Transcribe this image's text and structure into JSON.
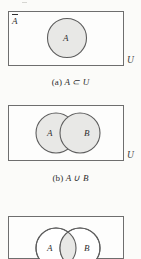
{
  "figure": {
    "panels": [
      {
        "id": "a",
        "caption_index": "(a)",
        "caption_expr": "A ⊂ U",
        "universe_label": "U",
        "complement_label": "A",
        "sets": [
          {
            "name": "A",
            "label": "A",
            "shaded": true
          }
        ],
        "description": "Single shaded circle A inside rectangle U, with complement label A-bar in the upper-left corner of U."
      },
      {
        "id": "b",
        "caption_index": "(b)",
        "caption_expr": "A ∪ B",
        "universe_label": "U",
        "sets": [
          {
            "name": "A",
            "label": "A",
            "shaded": true
          },
          {
            "name": "B",
            "label": "B",
            "shaded": true
          }
        ],
        "description": "Two overlapping circles A and B, both fully shaded, representing the union."
      },
      {
        "id": "c",
        "caption_index": "(c)",
        "caption_expr": "A ∩ B",
        "universe_label": "U",
        "sets": [
          {
            "name": "A",
            "label": "A",
            "shaded": false
          },
          {
            "name": "B",
            "label": "B",
            "shaded": false
          }
        ],
        "intersection_shaded": true,
        "description": "Two overlapping unshaded circles A and B with only the lens-shaped intersection shaded."
      }
    ]
  },
  "colors": {
    "page_background": "#fbfbf9",
    "box_stroke": "#6e6e6e",
    "circle_stroke": "#5d5d5d",
    "circle_fill": "#e8e8e6",
    "text": "#2e2e2e"
  }
}
